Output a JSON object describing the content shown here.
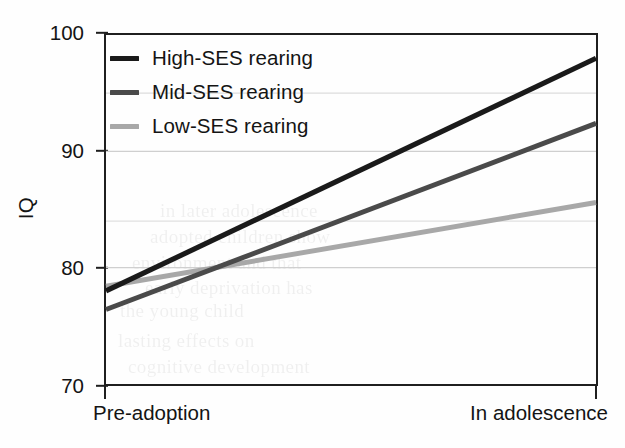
{
  "chart_data": {
    "type": "line",
    "title": "",
    "xlabel": "",
    "ylabel": "IQ",
    "x": [
      "Pre-adoption",
      "In adolescence"
    ],
    "x_tick_labels": [
      "Pre-adoption",
      "In adolescence"
    ],
    "y_tick_labels": [
      "100",
      "90",
      "80",
      "70"
    ],
    "y_ticks": [
      100,
      90,
      80,
      70
    ],
    "ylim": [
      70,
      100
    ],
    "grid": "faint horizontal gridlines at 95, 90, 84, 80",
    "gridlines": [
      95,
      90,
      84,
      80
    ],
    "legend_position": "top-left inside plot area",
    "series": [
      {
        "name": "High-SES rearing",
        "values": [
          78.0,
          98.0
        ],
        "color": "#1a1a1a",
        "linewidth": 4.6
      },
      {
        "name": "Mid-SES rearing",
        "values": [
          76.4,
          92.4
        ],
        "color": "#4a4a4a",
        "linewidth": 4.6
      },
      {
        "name": "Low-SES rearing",
        "values": [
          78.4,
          85.6
        ],
        "color": "#a8a8a8",
        "linewidth": 4.6
      }
    ]
  },
  "axes": {
    "y_title": "IQ",
    "y_tick_labels": [
      "100",
      "90",
      "80",
      "70"
    ],
    "x_tick_labels": {
      "left": "Pre-adoption",
      "right": "In adolescence"
    }
  },
  "legend": {
    "entries": [
      {
        "label": "High-SES rearing",
        "color": "#1a1a1a"
      },
      {
        "label": "Mid-SES rearing",
        "color": "#4a4a4a"
      },
      {
        "label": "Low-SES rearing",
        "color": "#a8a8a8"
      }
    ]
  },
  "colors": {
    "axis": "#1f1f1f",
    "text": "#141414",
    "gridline": "#d8d8d8",
    "background": "#fefefe",
    "high_ses": "#1a1a1a",
    "mid_ses": "#4a4a4a",
    "low_ses": "#a8a8a8"
  },
  "scan_artifacts": {
    "ghost_text": [
      "the young child",
      "adopted children show",
      "environment and that",
      "early deprivation has",
      "lasting effects on",
      "cognitive development",
      "in later adolescence"
    ]
  }
}
